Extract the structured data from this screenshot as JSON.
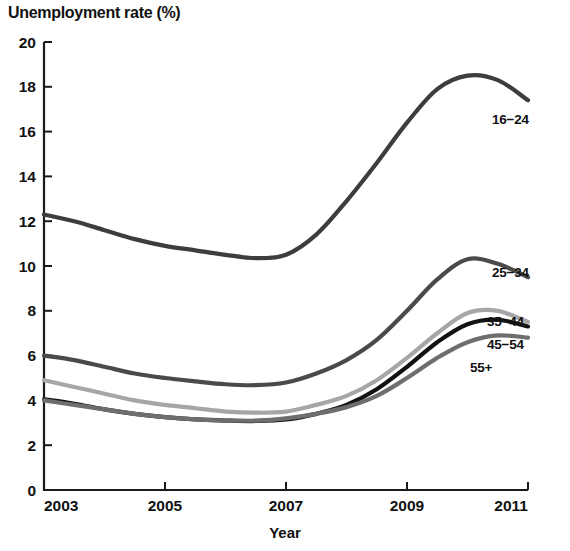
{
  "chart_data": {
    "type": "line",
    "title": "Unemployment rate (%)",
    "xlabel": "Year",
    "ylabel": "Unemployment rate (%)",
    "xlim": [
      2003,
      2011
    ],
    "ylim": [
      0,
      20
    ],
    "grid": false,
    "legend_position": "right-inline-labels",
    "xticks": [
      "2003",
      "2005",
      "2007",
      "2009",
      "2011"
    ],
    "yticks": [
      "0",
      "2",
      "4",
      "6",
      "8",
      "10",
      "12",
      "14",
      "16",
      "18",
      "20"
    ],
    "x": [
      2003,
      2003.5,
      2004,
      2004.5,
      2005,
      2005.5,
      2006,
      2006.5,
      2007,
      2007.5,
      2008,
      2008.5,
      2009,
      2009.5,
      2010,
      2010.5,
      2011
    ],
    "series": [
      {
        "name": "16-24",
        "label": "16−24",
        "color": "#3d3d3d",
        "values": [
          12.3,
          12.0,
          11.6,
          11.2,
          10.9,
          10.7,
          10.5,
          10.35,
          10.5,
          11.4,
          12.9,
          14.6,
          16.4,
          17.9,
          18.5,
          18.3,
          17.4
        ]
      },
      {
        "name": "25-34",
        "label": "25−34",
        "color": "#4a4a4a",
        "values": [
          6.0,
          5.8,
          5.5,
          5.2,
          5.0,
          4.85,
          4.72,
          4.68,
          4.8,
          5.2,
          5.8,
          6.7,
          8.0,
          9.4,
          10.3,
          10.1,
          9.5
        ]
      },
      {
        "name": "35-44",
        "label": "35−44",
        "color": "#a6a6a6",
        "values": [
          4.9,
          4.6,
          4.3,
          4.0,
          3.8,
          3.65,
          3.5,
          3.45,
          3.5,
          3.8,
          4.2,
          4.9,
          5.9,
          7.0,
          7.9,
          8.0,
          7.5
        ]
      },
      {
        "name": "45-54",
        "label": "45−54",
        "color": "#121212",
        "values": [
          4.05,
          3.85,
          3.6,
          3.4,
          3.25,
          3.15,
          3.1,
          3.08,
          3.15,
          3.4,
          3.8,
          4.5,
          5.5,
          6.6,
          7.4,
          7.6,
          7.3
        ]
      },
      {
        "name": "55+",
        "label": "55+",
        "color": "#6e6e6e",
        "values": [
          4.0,
          3.8,
          3.6,
          3.4,
          3.25,
          3.15,
          3.1,
          3.1,
          3.2,
          3.4,
          3.7,
          4.2,
          5.0,
          5.9,
          6.6,
          6.9,
          6.8
        ]
      }
    ]
  },
  "axes": {
    "x_title": "Year"
  }
}
